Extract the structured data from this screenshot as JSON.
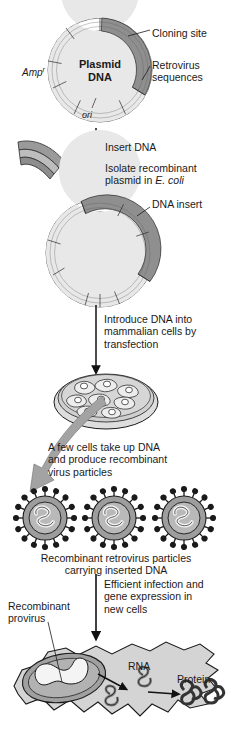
{
  "figure": {
    "palette": {
      "dark_gray": "#8a8a8a",
      "mid_gray": "#b5b5b5",
      "light_gray": "#d9d9d9",
      "pale_gray": "#ececec",
      "outline": "#1a1a1a",
      "arrow_gray": "#9a9a9a",
      "background": "#ffffff"
    }
  },
  "labels": {
    "cloning_site": "Cloning site",
    "retrovirus_sequences_line1": "Retrovirus",
    "retrovirus_sequences_line2": "sequences",
    "amp_resistance": "Amp",
    "amp_superscript": "r",
    "plasmid_line1": "Plasmid",
    "plasmid_line2": "DNA",
    "ori": "ori",
    "insert_dna": "Insert DNA",
    "isolate_line1": "Isolate recombinant",
    "isolate_line2_pre": "plasmid in ",
    "isolate_line2_italic": "E. coli",
    "dna_insert": "DNA insert",
    "introduce_line1": "Introduce DNA into",
    "introduce_line2": "mammalian cells by",
    "introduce_line3": "transfection",
    "few_cells_line1": "A few cells take up DNA",
    "few_cells_line2": "and produce recombinant",
    "few_cells_line3": "virus particles",
    "recombinant_particles_line1": "Recombinant retrovirus particles",
    "recombinant_particles_line2": "carrying inserted DNA",
    "efficient_line1": "Efficient infection and",
    "efficient_line2": "gene expression in",
    "efficient_line3": "new cells",
    "recombinant_provirus_line1": "Recombinant",
    "recombinant_provirus_line2": "provirus",
    "rna": "RNA",
    "protein": "Protein"
  },
  "steps": [
    {
      "id": "plasmid-vector",
      "name": "Plasmid DNA with retrovirus sequences and cloning site"
    },
    {
      "id": "insert-dna",
      "name": "Insert DNA fragment"
    },
    {
      "id": "recombinant-plasmid",
      "name": "Recombinant plasmid with DNA insert"
    },
    {
      "id": "transfection",
      "name": "Transfection into mammalian cells"
    },
    {
      "id": "cell-culture-dish",
      "name": "Petri dish of transfected mammalian cells"
    },
    {
      "id": "virus-particles",
      "name": "Three recombinant retrovirus particles"
    },
    {
      "id": "infected-cell",
      "name": "Infected cell with provirus, RNA and protein"
    }
  ],
  "counts": {
    "virus_particles": 3,
    "plasmid_segments_top": 6,
    "spikes_per_particle": 16
  }
}
